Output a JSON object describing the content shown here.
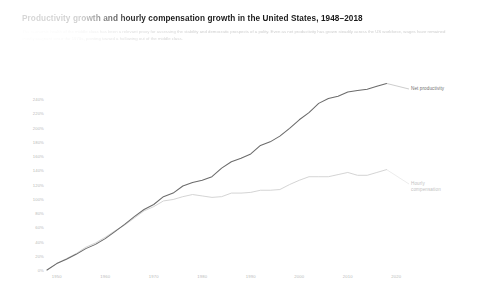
{
  "header": {
    "title": "Productivity growth and hourly compensation growth in the United States, 1948–2018",
    "subtitle": "The economic health of the middle class has been a relevant proxy for assessing the stability and democratic prospects of a polity. Even as net productivity has grown steadily across the US workforce, wages have remained mostly stagnant since the 1970s, pointing toward a hollowing out of the middle class."
  },
  "labels": {
    "net_productivity": "Net productivity",
    "hourly_compensation": "Hourly\ncompensation"
  },
  "chart_data": {
    "type": "line",
    "title": "Productivity growth and hourly compensation growth in the United States, 1948–2018",
    "xlabel": "",
    "ylabel": "",
    "xlim": [
      1948,
      2022
    ],
    "ylim": [
      0,
      250
    ],
    "grid": false,
    "legend_position": "right-inline",
    "ytick_labels": [
      "240%",
      "220%",
      "200%",
      "180%",
      "160%",
      "140%",
      "120%",
      "100%",
      "80%",
      "60%",
      "40%",
      "20%",
      "0%"
    ],
    "ytick_values": [
      240,
      220,
      200,
      180,
      160,
      140,
      120,
      100,
      80,
      60,
      40,
      20,
      0
    ],
    "xtick_labels": [
      "1950",
      "1960",
      "1970",
      "1980",
      "1990",
      "2000",
      "2010",
      "2020"
    ],
    "xtick_values": [
      1950,
      1960,
      1970,
      1980,
      1990,
      2000,
      2010,
      2020
    ],
    "x": [
      1948,
      1950,
      1952,
      1954,
      1956,
      1958,
      1960,
      1962,
      1964,
      1966,
      1968,
      1970,
      1972,
      1974,
      1976,
      1978,
      1980,
      1982,
      1984,
      1986,
      1988,
      1990,
      1992,
      1994,
      1996,
      1998,
      2000,
      2002,
      2004,
      2006,
      2008,
      2010,
      2012,
      2014,
      2016,
      2018
    ],
    "series": [
      {
        "name": "Net productivity",
        "color": "#6b6b6b",
        "values": [
          0,
          9,
          15,
          22,
          30,
          36,
          44,
          54,
          64,
          75,
          85,
          92,
          103,
          108,
          118,
          123,
          126,
          131,
          143,
          152,
          157,
          163,
          175,
          180,
          188,
          199,
          211,
          221,
          234,
          241,
          244,
          250,
          252,
          254,
          258,
          262
        ]
      },
      {
        "name": "Hourly compensation",
        "color": "#cfcfcf",
        "values": [
          0,
          9,
          16,
          23,
          32,
          38,
          46,
          55,
          63,
          73,
          83,
          89,
          97,
          99,
          103,
          106,
          104,
          102,
          103,
          108,
          108,
          109,
          112,
          112,
          113,
          120,
          126,
          131,
          131,
          131,
          134,
          137,
          133,
          133,
          137,
          141
        ]
      }
    ]
  }
}
